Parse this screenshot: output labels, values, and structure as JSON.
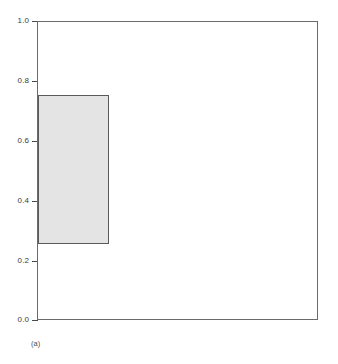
{
  "figure": {
    "caption": "(a)",
    "background_color": "#ffffff"
  },
  "axes": {
    "frame_color": "#6b6b6b",
    "tick_color": "#4a4a4a",
    "label_color": "#3b3b3b",
    "x_ticklabels": [],
    "y_ticklabels": [
      "0.0",
      "0.2",
      "0.4",
      "0.6",
      "0.8",
      "1.0"
    ]
  },
  "chart_data": {
    "type": "bar",
    "title": "",
    "subtitle": "",
    "xlabel": "",
    "ylabel": "",
    "xlim": [
      0.0,
      1.0
    ],
    "ylim": [
      0.0,
      1.0
    ],
    "grid": false,
    "legend": null,
    "xticks": [],
    "yticks": [
      0.0,
      0.2,
      0.4,
      0.6,
      0.8,
      1.0
    ],
    "yticklabels": [
      "0.0",
      "0.2",
      "0.4",
      "0.6",
      "0.8",
      "1.0"
    ],
    "annotations": [
      {
        "text": "(a)",
        "position": "below-axes-left"
      }
    ],
    "series": [
      {
        "name": "rectangle",
        "shape": "rectangle",
        "fill_color": "#e4e4e4",
        "edge_color": "#5a5a5a",
        "x0": 0.0,
        "x1": 0.253,
        "y0": 0.251,
        "y1": 0.753,
        "width": 0.253,
        "height": 0.502
      }
    ],
    "categories": [
      "rectangle"
    ],
    "values": [
      0.502
    ]
  }
}
